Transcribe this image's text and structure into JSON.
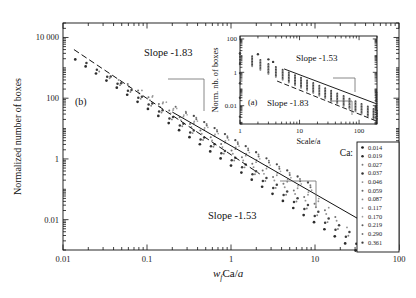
{
  "figure": {
    "panel_label_main": "(b)",
    "panel_label_inset": "(a)",
    "background": "#ffffff",
    "ink": "#111111"
  },
  "chart_data": {
    "type": "scatter",
    "title": "",
    "xlabel": "w_f Ca/a",
    "xlabel_parts": {
      "w": "w",
      "sub_f": "f",
      "ca": "Ca",
      "slash": "/",
      "a": "a"
    },
    "ylabel": "Normalized number of boxes",
    "xscale": "log",
    "yscale": "log",
    "xlim": [
      0.01,
      100
    ],
    "ylim": [
      0.001,
      30000
    ],
    "xticklabels": [
      "0.01",
      "0.1",
      "1",
      "10",
      "100"
    ],
    "xtickvalues": [
      0.01,
      0.1,
      1,
      10,
      100
    ],
    "yticklabels": [
      "10 000",
      "100",
      "1",
      "0.01"
    ],
    "ytickvalues": [
      10000,
      100,
      1,
      0.01
    ],
    "grid": false,
    "annotations": [
      {
        "text": "Slope -1.83",
        "slope": -1.83,
        "x": 0.13,
        "y": 900
      },
      {
        "text": "Slope -1.53",
        "slope": -1.53,
        "x": 3.2,
        "y": 0.055
      },
      {
        "text": "(b)",
        "x": 0.022,
        "y": 3.0
      }
    ],
    "fit_lines": [
      {
        "name": "dashed-fit",
        "slope": -1.83,
        "style": "dashed",
        "x0": 0.0135,
        "y0": 4000,
        "x1": 2.2,
        "y1": 0.32
      },
      {
        "name": "solid-fit",
        "slope": -1.53,
        "style": "solid",
        "x0": 0.2,
        "y0": 35.0,
        "x1": 33.0,
        "y1": 0.0105
      }
    ],
    "legend": {
      "title": "Ca:",
      "position": "lower-right",
      "entries": [
        "0.014",
        "0.019",
        "0.027",
        "0.037",
        "0.046",
        "0.059",
        "0.087",
        "0.117",
        "0.170",
        "0.219",
        "0.290",
        "0.361"
      ]
    },
    "series": [
      {
        "name": "0.014",
        "x": [
          0.014,
          0.0186,
          0.0247,
          0.0329,
          0.0437,
          0.0581,
          0.0772,
          0.1026,
          0.1364,
          0.1813,
          0.241,
          0.3203,
          0.4257,
          0.5659,
          0.7521,
          0.9997,
          1.3287,
          1.7661,
          2.3475,
          3.1203,
          4.1473,
          5.5125,
          7.3268,
          9.7383,
          12.944,
          17.204,
          22.866,
          30.392
        ],
        "y": [
          1900,
          1110,
          650,
          380,
          222,
          130,
          76,
          44.4,
          26.0,
          15.2,
          8.88,
          5.19,
          3.04,
          1.77,
          1.04,
          0.606,
          0.354,
          0.207,
          0.121,
          0.0707,
          0.0413,
          0.0242,
          0.0141,
          0.00825,
          0.00482,
          0.00282,
          0.00165,
          0.00096
        ]
      },
      {
        "name": "0.019",
        "x": [
          0.019,
          0.0253,
          0.0336,
          0.0446,
          0.0593,
          0.0788,
          0.1047,
          0.1392,
          0.185,
          0.2459,
          0.3268,
          0.4344,
          0.5773,
          0.7673,
          1.0198,
          1.3554,
          1.8015,
          2.3945,
          3.1824,
          4.2298,
          5.6222,
          7.4726,
          9.9322,
          13.201,
          17.546,
          23.321,
          30.996
        ],
        "y": [
          1450,
          860,
          508,
          300,
          177,
          104,
          61.5,
          36.3,
          21.4,
          12.6,
          7.46,
          4.4,
          2.6,
          1.53,
          0.905,
          0.534,
          0.315,
          0.186,
          0.11,
          0.0648,
          0.0382,
          0.0226,
          0.0133,
          0.00785,
          0.00463,
          0.00273,
          0.00161
        ]
      },
      {
        "name": "0.027",
        "x": [
          0.027,
          0.0359,
          0.0477,
          0.0634,
          0.0842,
          0.112,
          0.1488,
          0.1978,
          0.2629,
          0.3494,
          0.4644,
          0.6173,
          0.8204,
          1.0904,
          1.4494,
          1.9265,
          2.5606,
          3.4034,
          4.5236,
          6.0125,
          7.9913,
          10.622,
          14.118,
          18.765,
          24.941
        ],
        "y": [
          760,
          452,
          269,
          160,
          95.2,
          56.6,
          33.7,
          20.0,
          11.9,
          7.09,
          4.22,
          2.51,
          1.49,
          0.888,
          0.528,
          0.314,
          0.187,
          0.111,
          0.0662,
          0.0394,
          0.0234,
          0.0139,
          0.00829,
          0.00493,
          0.00294
        ]
      },
      {
        "name": "0.037",
        "x": [
          0.037,
          0.0492,
          0.0654,
          0.0869,
          0.1155,
          0.1535,
          0.204,
          0.2712,
          0.3604,
          0.479,
          0.6366,
          0.8462,
          1.1246,
          1.4947,
          1.9866,
          2.6404,
          3.5092,
          4.664,
          6.1988,
          8.2386,
          10.948,
          14.551,
          19.339,
          25.702
        ],
        "y": [
          520,
          311,
          186,
          111,
          66.7,
          39.9,
          23.9,
          14.3,
          8.56,
          5.12,
          3.07,
          1.84,
          1.1,
          0.659,
          0.394,
          0.236,
          0.141,
          0.0845,
          0.0506,
          0.0303,
          0.0181,
          0.0109,
          0.0065,
          0.00389
        ]
      },
      {
        "name": "0.046",
        "x": [
          0.046,
          0.0611,
          0.0812,
          0.108,
          0.1435,
          0.1907,
          0.2535,
          0.3369,
          0.4478,
          0.5952,
          0.7911,
          1.0514,
          1.3974,
          1.8572,
          2.4684,
          3.2805,
          4.36,
          5.7949,
          7.702,
          10.237,
          13.605,
          18.082,
          24.033
        ],
        "y": [
          400,
          240,
          144,
          86.4,
          51.9,
          31.2,
          18.7,
          11.3,
          6.78,
          4.08,
          2.45,
          1.48,
          0.888,
          0.535,
          0.322,
          0.194,
          0.117,
          0.0702,
          0.0423,
          0.0255,
          0.0153,
          0.00923,
          0.00556
        ]
      },
      {
        "name": "0.059",
        "x": [
          0.059,
          0.0784,
          0.1042,
          0.1385,
          0.1841,
          0.2447,
          0.3252,
          0.4322,
          0.5744,
          0.7635,
          1.0148,
          1.3488,
          1.7926,
          2.3827,
          3.1669,
          4.209,
          5.5939,
          7.4348,
          9.8811,
          13.133,
          17.455
        ],
        "y": [
          295,
          178,
          107,
          64.8,
          39.1,
          23.6,
          14.2,
          8.59,
          5.18,
          3.13,
          1.89,
          1.14,
          0.69,
          0.417,
          0.252,
          0.152,
          0.092,
          0.0556,
          0.0336,
          0.0203,
          0.0123
        ]
      },
      {
        "name": "0.087",
        "x": [
          0.087,
          0.1156,
          0.1537,
          0.2043,
          0.2715,
          0.3609,
          0.4797,
          0.6376,
          0.8475,
          1.1264,
          1.4971,
          1.9899,
          2.6448,
          3.5151,
          4.6718,
          6.2092,
          8.2524,
          10.967,
          14.576
        ],
        "y": [
          180,
          110,
          66.8,
          40.7,
          24.8,
          15.1,
          9.22,
          5.62,
          3.43,
          2.09,
          1.28,
          0.779,
          0.476,
          0.29,
          0.177,
          0.108,
          0.0661,
          0.0404,
          0.0247
        ]
      },
      {
        "name": "0.117",
        "x": [
          0.117,
          0.1555,
          0.2067,
          0.2747,
          0.3651,
          0.4853,
          0.645,
          0.8573,
          1.1394,
          1.5143,
          2.0126,
          2.675,
          3.5553,
          4.7252,
          6.2802,
          8.3468,
          11.093
        ],
        "y": [
          120,
          73.7,
          45.3,
          27.8,
          17.1,
          10.5,
          6.45,
          3.96,
          2.44,
          1.5,
          0.92,
          0.565,
          0.347,
          0.213,
          0.131,
          0.0804,
          0.0494
        ]
      },
      {
        "name": "0.170",
        "x": [
          0.17,
          0.2259,
          0.3003,
          0.3991,
          0.5304,
          0.705,
          0.937,
          1.2453,
          1.6551,
          2.1998,
          2.9238,
          3.8859,
          5.1646,
          6.8641,
          9.1231
        ],
        "y": [
          74.0,
          45.9,
          28.5,
          17.7,
          11.0,
          6.83,
          4.24,
          2.63,
          1.63,
          1.01,
          0.629,
          0.39,
          0.242,
          0.15,
          0.0934
        ]
      },
      {
        "name": "0.219",
        "x": [
          0.219,
          0.2911,
          0.3868,
          0.5141,
          0.6833,
          0.9081,
          1.2069,
          1.604,
          2.1318,
          2.8331,
          3.7653,
          5.004,
          6.6504,
          8.8385
        ],
        "y": [
          52.0,
          32.5,
          20.3,
          12.7,
          7.93,
          4.96,
          3.1,
          1.94,
          1.21,
          0.757,
          0.473,
          0.296,
          0.185,
          0.116
        ]
      },
      {
        "name": "0.290",
        "x": [
          0.29,
          0.3854,
          0.5122,
          0.6808,
          0.9048,
          1.2025,
          1.5982,
          2.1241,
          2.8228,
          3.7516,
          4.9858,
          6.6262,
          8.8063
        ],
        "y": [
          36.0,
          22.6,
          14.2,
          8.94,
          5.62,
          3.54,
          2.22,
          1.4,
          0.879,
          0.553,
          0.347,
          0.218,
          0.137
        ]
      },
      {
        "name": "0.361",
        "x": [
          0.361,
          0.4798,
          0.6376,
          0.8474,
          1.1263,
          1.4969,
          1.9895,
          2.6443,
          3.5144,
          4.6708,
          6.2078,
          8.2506
        ],
        "y": [
          26.0,
          16.4,
          10.4,
          6.57,
          4.15,
          2.62,
          1.66,
          1.05,
          0.662,
          0.418,
          0.264,
          0.167
        ]
      }
    ]
  },
  "inset_chart_data": {
    "type": "scatter",
    "xlabel": "Scale/a",
    "ylabel": "Norm. nb. of boxes",
    "panel_label": "(a)",
    "xscale": "log",
    "yscale": "log",
    "xlim": [
      1,
      200
    ],
    "ylim": [
      0.0008,
      150
    ],
    "xticklabels": [
      "1",
      "10",
      "100"
    ],
    "xtickvalues": [
      1,
      10,
      100
    ],
    "yticklabels": [
      "100",
      "1",
      "0.01"
    ],
    "ytickvalues": [
      100,
      1,
      0.01
    ],
    "grid": false,
    "annotations": [
      {
        "text": "Slope -1.53",
        "slope": -1.53
      },
      {
        "text": "Slope -1.83",
        "slope": -1.83
      }
    ],
    "fit_lines": [
      {
        "name": "solid-fit",
        "slope": -1.53,
        "style": "solid",
        "x0": 5.5,
        "y0": 1.6,
        "x1": 190,
        "y1": 0.0135
      },
      {
        "name": "dashed-fit",
        "slope": -1.83,
        "style": "dashed",
        "x0": 4.2,
        "y0": 0.3,
        "x1": 190,
        "y1": 0.00125
      }
    ],
    "series": [
      {
        "name": "band",
        "x": [
          1.0,
          1.6,
          2.2,
          3.0,
          4.0,
          5.2,
          6.6,
          8.4,
          10.6,
          13.4,
          17,
          21.5,
          27,
          34,
          43,
          55,
          69,
          87,
          110,
          140,
          175,
          200
        ],
        "y": [
          12.0,
          9.2,
          5.6,
          3.2,
          2.1,
          1.42,
          0.98,
          0.67,
          0.47,
          0.33,
          0.23,
          0.16,
          0.112,
          0.078,
          0.054,
          0.038,
          0.0265,
          0.0185,
          0.0129,
          0.009,
          0.0063,
          0.005
        ]
      }
    ]
  }
}
